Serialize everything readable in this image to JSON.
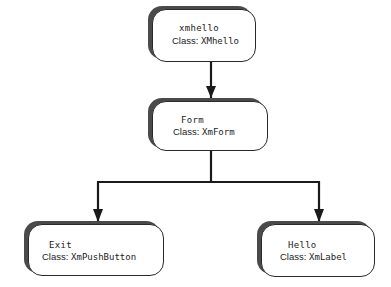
{
  "diagram": {
    "type": "widget-tree",
    "colors": {
      "stroke": "#2a2a2a",
      "shadow": "#4a4a4a",
      "fill": "#ffffff",
      "text": "#222222"
    },
    "nodes": [
      {
        "id": "xmhello",
        "name": "xmhello",
        "class_label": "Class:",
        "class_name": "XMhello"
      },
      {
        "id": "form",
        "name": "Form",
        "class_label": "Class:",
        "class_name": "XmForm"
      },
      {
        "id": "exit",
        "name": "Exit",
        "class_label": "Class:",
        "class_name": "XmPushButton"
      },
      {
        "id": "hello",
        "name": "Hello",
        "class_label": "Class:",
        "class_name": "XmLabel"
      }
    ],
    "edges": [
      {
        "from": "xmhello",
        "to": "form"
      },
      {
        "from": "form",
        "to": "exit"
      },
      {
        "from": "form",
        "to": "hello"
      }
    ]
  }
}
